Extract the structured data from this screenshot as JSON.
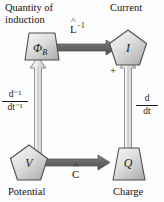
{
  "diagram": {
    "type": "node-arrow-diagram",
    "background_color": "#fdfdfd",
    "shape_fill_light": "#f2f2f2",
    "shape_fill_dark": "#b9b9b9",
    "shape_stroke": "#4a4a4a",
    "arrow_solid_color": "#6e6e6e",
    "arrow_hollow_fill": "#e6e6e6",
    "nodes": [
      {
        "id": "flux",
        "symbol": "Φ",
        "subscript": "B",
        "caption": "Quantity of induction",
        "caption_line1": "Quantity of",
        "caption_line2": "induction",
        "shape": "trapezoid",
        "position": "top-left"
      },
      {
        "id": "current",
        "symbol": "I",
        "subscript": "",
        "caption": "Current",
        "shape": "pentagon",
        "position": "top-right"
      },
      {
        "id": "potential",
        "symbol": "V",
        "subscript": "",
        "caption": "Potential",
        "shape": "pentagon",
        "position": "bottom-left"
      },
      {
        "id": "charge",
        "symbol": "Q",
        "subscript": "",
        "caption": "Charge",
        "shape": "trapezoid",
        "position": "bottom-right"
      }
    ],
    "edges": [
      {
        "id": "top-edge",
        "from": "flux",
        "to": "current",
        "direction": "right",
        "style": "solid-block-arrow",
        "label_base": "L",
        "label_hat": "˄",
        "label_exponent": "−1",
        "label_text": "L̂⁻¹"
      },
      {
        "id": "bottom-edge",
        "from": "potential",
        "to": "charge",
        "direction": "right",
        "style": "solid-block-arrow",
        "label_base": "C",
        "label_hat": "˄",
        "label_exponent": "",
        "label_text": "Ĉ"
      },
      {
        "id": "left-edge",
        "from": "potential",
        "to": "flux",
        "direction": "up",
        "style": "hollow-block-arrow",
        "label_numerator": "d⁻¹",
        "label_denominator": "dt⁻¹",
        "label_text": "d⁻¹ / dt⁻¹"
      },
      {
        "id": "right-edge",
        "from": "charge",
        "to": "current",
        "direction": "up",
        "style": "hollow-block-arrow",
        "label_numerator": "d",
        "label_denominator": "dt",
        "label_text": "d / dt"
      }
    ],
    "annotations": [
      {
        "id": "plus-sign",
        "text": "+",
        "near": "current"
      }
    ]
  }
}
